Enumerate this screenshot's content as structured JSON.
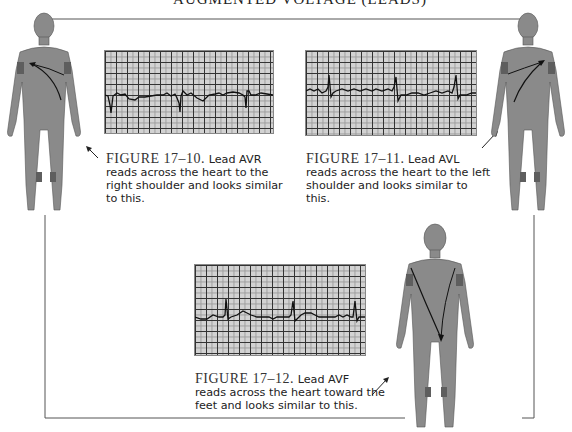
{
  "title": "AUGMENTED VOLTAGE (LEADS)",
  "figures": [
    {
      "id": "17-10",
      "label": "FIGURE 17–10.",
      "text": "Lead AVR reads across the heart to the right shoulder and looks similar to this.",
      "text_lines": [
        "reads across the heart to the",
        "right shoulder and looks similar",
        "to this."
      ],
      "lead_prefix": "Lead AVR",
      "lead": "AVR",
      "direction": "right shoulder"
    },
    {
      "id": "17-11",
      "label": "FIGURE 17–11.",
      "text": "Lead AVL reads across the heart to the left shoulder and looks similar to this.",
      "text_lines": [
        "reads across the heart to the left",
        "shoulder and looks similar to",
        "this."
      ],
      "lead_prefix": "Lead AVL",
      "lead": "AVL",
      "direction": "left shoulder"
    },
    {
      "id": "17-12",
      "label": "FIGURE 17–12.",
      "text": "Lead AVF reads across the heart toward the feet and looks similar to this.",
      "text_lines": [
        "reads across the heart toward the",
        "feet and looks similar to this."
      ],
      "lead_prefix": "Lead AVF",
      "lead": "AVF",
      "direction": "feet"
    }
  ],
  "colors": {
    "body": "#8a8a8a",
    "electrode": "#5e5e5e",
    "ecg_paper": "#d2d2d2",
    "ecg_grid": "#333333",
    "trace": "#111111"
  }
}
